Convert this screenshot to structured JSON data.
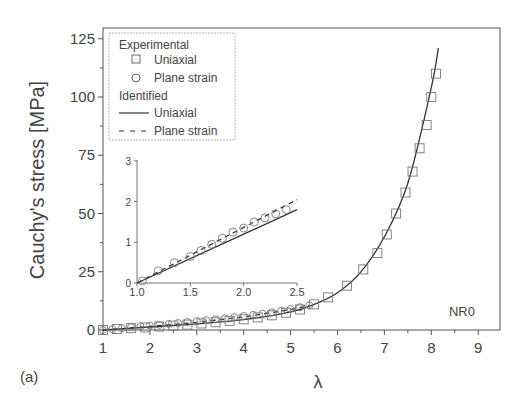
{
  "panel_label": "(a)",
  "chart_data": {
    "type": "scatter",
    "title": "",
    "xlabel": "λ",
    "ylabel": "Cauchy's stress [MPa]",
    "xlim": [
      1,
      9.5
    ],
    "ylim": [
      0,
      130
    ],
    "xticks": [
      "1",
      "2",
      "3",
      "4",
      "5",
      "6",
      "7",
      "8",
      "9"
    ],
    "yticks": [
      "0",
      "25",
      "50",
      "75",
      "100",
      "125"
    ],
    "grid": false,
    "annotation": "NR0",
    "legend": {
      "position": "upper-left",
      "groups": [
        {
          "title": "Experimental",
          "entries": [
            {
              "marker": "square",
              "label": "Uniaxial"
            },
            {
              "marker": "circle",
              "label": "Plane strain"
            }
          ]
        },
        {
          "title": "Identified",
          "entries": [
            {
              "line": "solid",
              "label": "Uniaxial"
            },
            {
              "line": "dashed",
              "label": "Plane strain"
            }
          ]
        }
      ]
    },
    "series": [
      {
        "name": "Experimental Uniaxial",
        "marker": "square",
        "x": [
          1.0,
          1.3,
          1.6,
          1.9,
          2.2,
          2.5,
          2.8,
          3.1,
          3.4,
          3.7,
          4.0,
          4.3,
          4.6,
          4.9,
          5.2,
          5.5,
          5.8,
          6.2,
          6.55,
          6.85,
          7.05,
          7.25,
          7.45,
          7.6,
          7.75,
          7.9,
          8.0,
          8.1
        ],
        "y": [
          0,
          0.4,
          0.8,
          1.1,
          1.5,
          1.9,
          2.3,
          2.8,
          3.3,
          3.9,
          4.6,
          5.4,
          6.3,
          7.4,
          8.8,
          11,
          14,
          19,
          26,
          33,
          41,
          50,
          59,
          68,
          78,
          88,
          100,
          110
        ]
      },
      {
        "name": "Experimental Plane strain",
        "marker": "circle",
        "x": [
          1.0,
          1.2,
          1.4,
          1.6,
          1.8,
          2.0,
          2.2,
          2.4,
          2.6,
          2.8,
          3.0,
          3.2,
          3.4,
          3.6,
          3.8,
          4.0,
          4.2,
          4.4,
          4.6,
          4.8,
          5.0,
          5.2,
          5.4
        ],
        "y": [
          0,
          0.4,
          0.8,
          1.2,
          1.6,
          1.9,
          2.2,
          2.6,
          3.0,
          3.4,
          3.8,
          4.2,
          4.6,
          5.0,
          5.5,
          6.0,
          6.5,
          7.0,
          7.6,
          8.3,
          9.0,
          9.8,
          10.6
        ]
      },
      {
        "name": "Identified Uniaxial",
        "line": "solid",
        "x": [
          1,
          2,
          3,
          4,
          5,
          5.5,
          6,
          6.5,
          7,
          7.5,
          8,
          8.15
        ],
        "y": [
          0,
          1.3,
          2.6,
          4.4,
          7.8,
          11,
          16,
          25,
          40,
          63,
          104,
          121
        ]
      },
      {
        "name": "Identified Plane strain",
        "line": "dashed",
        "x": [
          1,
          2,
          3,
          4,
          5,
          5.4
        ],
        "y": [
          0,
          1.5,
          3.3,
          5.6,
          8.8,
          10.5
        ]
      }
    ],
    "inset": {
      "xlim": [
        1.0,
        2.5
      ],
      "ylim": [
        0,
        3
      ],
      "xticks": [
        "1.0",
        "1.5",
        "2.0",
        "2.5"
      ],
      "yticks": [
        "0",
        "1",
        "2",
        "3"
      ],
      "series": [
        {
          "name": "Experimental Plane strain",
          "marker": "circle",
          "x": [
            1.05,
            1.2,
            1.35,
            1.5,
            1.6,
            1.7,
            1.8,
            1.9,
            2.0,
            2.1,
            2.2,
            2.3,
            2.4
          ],
          "y": [
            0.05,
            0.3,
            0.5,
            0.65,
            0.8,
            0.95,
            1.1,
            1.25,
            1.35,
            1.5,
            1.6,
            1.7,
            1.8
          ]
        },
        {
          "name": "Identified Uniaxial",
          "line": "solid",
          "x": [
            1.0,
            2.5
          ],
          "y": [
            0,
            1.8
          ]
        },
        {
          "name": "Identified Plane strain",
          "line": "dashed",
          "x": [
            1.0,
            2.5
          ],
          "y": [
            0,
            2.05
          ]
        }
      ]
    }
  }
}
